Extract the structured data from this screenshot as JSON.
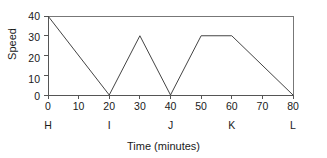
{
  "chart_data": {
    "type": "line",
    "title": "",
    "xlabel": "Time (minutes)",
    "ylabel": "Speed",
    "xlim": [
      0,
      80
    ],
    "ylim": [
      0,
      40
    ],
    "grid": false,
    "legend": "none",
    "x_ticks": [
      "0",
      "10",
      "20",
      "30",
      "40",
      "50",
      "60",
      "70",
      "80"
    ],
    "y_ticks": [
      "0",
      "10",
      "20",
      "30",
      "40"
    ],
    "x_tick_values": [
      0,
      10,
      20,
      30,
      40,
      50,
      60,
      70,
      80
    ],
    "y_tick_values": [
      0,
      10,
      20,
      30,
      40
    ],
    "point_labels": [
      {
        "label": "H",
        "x": 0
      },
      {
        "label": "I",
        "x": 20
      },
      {
        "label": "J",
        "x": 40
      },
      {
        "label": "K",
        "x": 60
      },
      {
        "label": "L",
        "x": 80
      }
    ],
    "x": [
      0,
      20,
      30,
      40,
      50,
      60,
      80
    ],
    "values": [
      40,
      0,
      30,
      0,
      30,
      30,
      0
    ],
    "series": [
      {
        "name": "Speed",
        "points": [
          {
            "x": 0,
            "y": 40
          },
          {
            "x": 20,
            "y": 0
          },
          {
            "x": 30,
            "y": 30
          },
          {
            "x": 40,
            "y": 0
          },
          {
            "x": 50,
            "y": 30
          },
          {
            "x": 60,
            "y": 30
          },
          {
            "x": 80,
            "y": 0
          }
        ]
      }
    ],
    "line_color": "#444444",
    "frame_color": "#555555"
  }
}
